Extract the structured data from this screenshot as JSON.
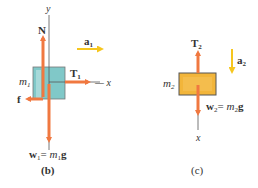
{
  "panel_b": {
    "caption": "(b)",
    "axis_y": "y",
    "axis_x": "x",
    "normal": "N",
    "tension": "T",
    "tension_sub": "1",
    "friction": "f",
    "mass": "m",
    "mass_sub": "1",
    "accel": "a",
    "accel_sub": "1",
    "weight_lhs": "w",
    "weight_sub": "1",
    "weight_eq": "= ",
    "weight_m": "m",
    "weight_m_sub": "1",
    "weight_g": "g"
  },
  "panel_c": {
    "caption": "(c)",
    "axis_x": "x",
    "tension": "T",
    "tension_sub": "2",
    "mass": "m",
    "mass_sub": "2",
    "accel": "a",
    "accel_sub": "2",
    "weight_lhs": "w",
    "weight_sub": "2",
    "weight_eq": "= ",
    "weight_m": "m",
    "weight_m_sub": "2",
    "weight_g": "g"
  },
  "colors": {
    "force_arrow": "#f07840",
    "accel_arrow": "#f6c61e",
    "block1": "#80c8c8",
    "block2": "#f2b53a",
    "axis": "#555555"
  }
}
